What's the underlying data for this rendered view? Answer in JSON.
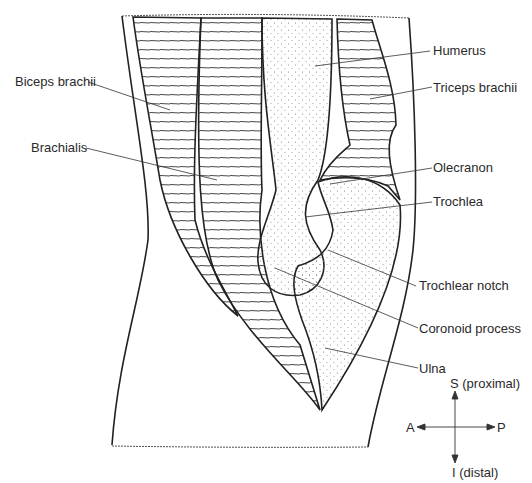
{
  "diagram": {
    "type": "anatomical-cross-section",
    "colors": {
      "line": "#222222",
      "background": "#ffffff",
      "text": "#2a2a2a"
    }
  },
  "labels": {
    "biceps_brachii": "Biceps brachii",
    "brachialis": "Brachialis",
    "humerus": "Humerus",
    "triceps_brachii": "Triceps brachii",
    "olecranon": "Olecranon",
    "trochlea": "Trochlea",
    "trochlear_notch": "Trochlear notch",
    "coronoid_process": "Coronoid process",
    "ulna": "Ulna"
  },
  "orientation": {
    "superior": "S (proximal)",
    "inferior": "I (distal)",
    "anterior": "A",
    "posterior": "P"
  }
}
